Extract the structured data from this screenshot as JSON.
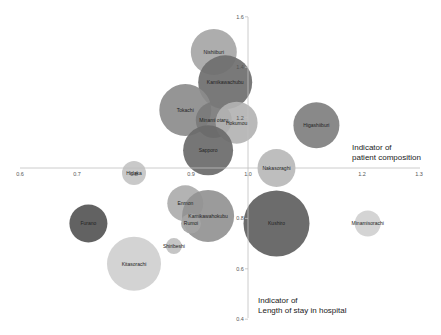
{
  "chart_data": {
    "type": "bubble",
    "title": "",
    "xlabel": "Indicator of patient composition",
    "ylabel": "Indicator of Length of stay in hospital",
    "xlabel_lines": [
      "Indicator of",
      "patient composition"
    ],
    "ylabel_lines": [
      "Indicator of",
      "Length of stay in hospital"
    ],
    "xlim": [
      0.6,
      1.3
    ],
    "ylim": [
      0.4,
      1.6
    ],
    "axes_cross_at": [
      1.0,
      1.0
    ],
    "x_ticks": [
      "0.6",
      "0.7",
      "0.8",
      "0.9",
      "1.0",
      "1.2",
      "1.3"
    ],
    "x_tick_values": [
      0.6,
      0.7,
      0.8,
      0.9,
      1.0,
      1.2,
      1.3
    ],
    "y_ticks": [
      "1.6",
      "1.4",
      "1.2",
      "1.0",
      "0.8",
      "0.6",
      "0.4"
    ],
    "y_tick_values": [
      1.6,
      1.4,
      1.2,
      1.0,
      0.8,
      0.6,
      0.4
    ],
    "grid": false,
    "legend": "none",
    "points": [
      {
        "name": "Nishiiburi",
        "x": 0.94,
        "y": 1.46,
        "r": 23,
        "color": "#a6a6a6"
      },
      {
        "name": "Kamikawachubu",
        "x": 0.96,
        "y": 1.34,
        "r": 27,
        "color": "#6e6e6e"
      },
      {
        "name": "Tokachi",
        "x": 0.89,
        "y": 1.23,
        "r": 26,
        "color": "#8c8c8c"
      },
      {
        "name": "Minami otaru",
        "x": 0.94,
        "y": 1.19,
        "r": 18,
        "color": "#7a7a7a"
      },
      {
        "name": "Hokumou",
        "x": 0.98,
        "y": 1.18,
        "r": 21,
        "color": "#b3b3b3"
      },
      {
        "name": "Higashiiburi",
        "x": 1.12,
        "y": 1.17,
        "r": 23,
        "color": "#7f7f7f"
      },
      {
        "name": "Sapporo",
        "x": 0.93,
        "y": 1.07,
        "r": 25,
        "color": "#6a6a6a"
      },
      {
        "name": "Nakasoraghi",
        "x": 1.05,
        "y": 1.0,
        "r": 19,
        "color": "#b8b8b8"
      },
      {
        "name": "Hidaka",
        "x": 0.8,
        "y": 0.98,
        "r": 12,
        "color": "#c4c4c4"
      },
      {
        "name": "Enmon",
        "x": 0.89,
        "y": 0.86,
        "r": 18,
        "color": "#adadad"
      },
      {
        "name": "Kamikawahokubu",
        "x": 0.93,
        "y": 0.81,
        "r": 26,
        "color": "#939393"
      },
      {
        "name": "Rumoi",
        "x": 0.9,
        "y": 0.78,
        "r": 10,
        "color": "#a5a5a5"
      },
      {
        "name": "Kushiro",
        "x": 1.05,
        "y": 0.78,
        "r": 33,
        "color": "#606060"
      },
      {
        "name": "Furano",
        "x": 0.72,
        "y": 0.78,
        "r": 19,
        "color": "#555555"
      },
      {
        "name": "Minamisorachi",
        "x": 1.21,
        "y": 0.78,
        "r": 13,
        "color": "#d0d0d0"
      },
      {
        "name": "Shiribeshi",
        "x": 0.87,
        "y": 0.69,
        "r": 8,
        "color": "#c0c0c0"
      },
      {
        "name": "Kitasorachi",
        "x": 0.8,
        "y": 0.62,
        "r": 27,
        "color": "#cfcfcf"
      }
    ]
  },
  "background_ghost_text": []
}
